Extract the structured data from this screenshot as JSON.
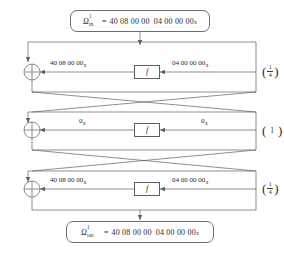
{
  "diagram": {
    "input_box": {
      "symbol": "Ω",
      "superscript": "1",
      "subscript": "in",
      "equals": "=",
      "value_left": "40 08 00 00",
      "value_right": "04 00 00 00",
      "hex_subscript": "x"
    },
    "output_box": {
      "symbol": "Ω",
      "superscript": "1",
      "subscript": "out",
      "equals": "=",
      "value_left": "40 08 00 00",
      "value_right": "04 00 00 00",
      "hex_subscript": "x"
    },
    "function_label": "f",
    "xor_symbol": "⊕",
    "rounds": [
      {
        "index": 1,
        "left_label": "40 08 00 00",
        "left_subscript": "x",
        "right_label": "04 00 00 00",
        "right_subscript": "x",
        "probability_display": "1/4",
        "probability_numerator": "1",
        "probability_denominator": "4",
        "probability_is_fraction": true
      },
      {
        "index": 2,
        "left_label": "0",
        "left_subscript": "x",
        "right_label": "0",
        "right_subscript": "x",
        "probability_display": "1",
        "probability_numerator": "1",
        "probability_denominator": "",
        "probability_is_fraction": false
      },
      {
        "index": 3,
        "left_label": "40 08 00 00",
        "left_subscript": "x",
        "right_label": "04 00 00 00",
        "right_subscript": "x",
        "probability_display": "1/4",
        "probability_numerator": "1",
        "probability_denominator": "4",
        "probability_is_fraction": true
      }
    ],
    "paren_open": "(",
    "paren_close": ")",
    "colors": {
      "line": "#5f5f5f",
      "text": "#2b2b2b",
      "background": "#ffffff"
    }
  }
}
